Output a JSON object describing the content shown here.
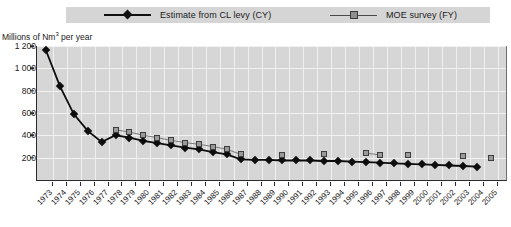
{
  "chart_data": {
    "type": "line",
    "title": "",
    "xlabel": "",
    "ylabel": "Millions of Nm3 per year",
    "ylabel_html": "Millions of Nm<sup>3</sup> per year",
    "ylim": [
      0,
      1200
    ],
    "yticks": [
      200,
      400,
      600,
      800,
      1000,
      1200
    ],
    "ytick_labels": [
      "200",
      "400",
      "600",
      "800",
      "1 000",
      "1 200"
    ],
    "grid": true,
    "legend_position": "top",
    "categories": [
      "1973",
      "1974",
      "1975",
      "1976",
      "1977",
      "1978",
      "1979",
      "1980",
      "1981",
      "1982",
      "1983",
      "1984",
      "1985",
      "1986",
      "1987",
      "1988",
      "1989",
      "1990",
      "1991",
      "1992",
      "1993",
      "1994",
      "1995",
      "1996",
      "1997",
      "1998",
      "1999",
      "2000",
      "2001",
      "2002",
      "2003",
      "2004",
      "2005"
    ],
    "series": [
      {
        "name": "Estimate from CL levy (CY)",
        "marker": "diamond",
        "color": "#0d0d0d",
        "values": [
          1160,
          840,
          590,
          440,
          340,
          400,
          380,
          350,
          330,
          310,
          290,
          275,
          250,
          230,
          185,
          180,
          180,
          175,
          175,
          175,
          170,
          170,
          165,
          160,
          155,
          150,
          145,
          140,
          135,
          130,
          125,
          120,
          null
        ]
      },
      {
        "name": "MOE survey (FY)",
        "marker": "square",
        "color": "#9a9a9a",
        "values": [
          null,
          null,
          null,
          null,
          null,
          450,
          430,
          400,
          380,
          355,
          335,
          320,
          300,
          275,
          230,
          null,
          null,
          225,
          null,
          null,
          230,
          null,
          null,
          240,
          225,
          null,
          220,
          null,
          null,
          null,
          215,
          null,
          195
        ]
      }
    ]
  },
  "legend": {
    "items": [
      {
        "label": "Estimate from CL levy (CY)",
        "marker": "diamond"
      },
      {
        "label": "MOE survey (FY)",
        "marker": "square"
      }
    ]
  }
}
